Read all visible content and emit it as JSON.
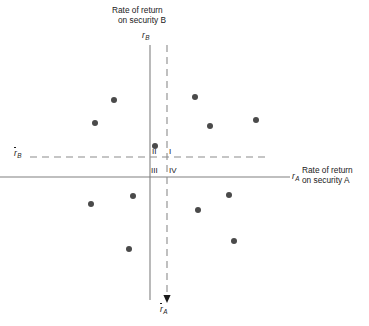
{
  "figure": {
    "background_color": "#ffffff",
    "axis_color": "#808080",
    "dash_color": "#8c8c8c",
    "point_color": "#4a4a4a",
    "text_color": "#1a1a1a"
  },
  "axes": {
    "vertical": {
      "symbol_letter": "r",
      "symbol_subscript": "B",
      "caption_line1": "Rate of return",
      "caption_line2": "on security B",
      "x_px": 150,
      "y_top_px": 45,
      "y_bottom_px": 300
    },
    "horizontal": {
      "symbol_letter": "r",
      "symbol_subscript": "A",
      "caption_line1": "Rate of return",
      "caption_line2": "on security A",
      "y_px": 177,
      "x_left_px": 0,
      "x_right_px": 290
    }
  },
  "reference_lines": {
    "mean_b": {
      "symbol_letter": "r",
      "symbol_subscript": "B",
      "overbar": true,
      "orientation": "horizontal",
      "y_px": 157,
      "x_start_px": 30,
      "x_end_px": 266
    },
    "mean_a": {
      "symbol_letter": "r",
      "symbol_subscript": "A",
      "overbar": true,
      "orientation": "vertical",
      "x_px": 167,
      "y_start_px": 45,
      "y_end_px": 300,
      "has_arrowhead": true
    }
  },
  "quadrants": [
    {
      "name": "quadrant-two",
      "label": "II",
      "x_px": 152,
      "y_px": 147
    },
    {
      "name": "quadrant-one",
      "label": "I",
      "x_px": 169,
      "y_px": 147
    },
    {
      "name": "quadrant-three",
      "label": "III",
      "x_px": 151,
      "y_px": 166
    },
    {
      "name": "quadrant-four",
      "label": "IV",
      "x_px": 169,
      "y_px": 166
    }
  ],
  "chart_data": {
    "type": "scatter",
    "title": "",
    "xlabel": "Rate of return on security A",
    "ylabel": "Rate of return on security B",
    "xlim": [
      0,
      369
    ],
    "ylim": [
      326,
      0
    ],
    "grid": false,
    "legend": false,
    "annotations": [
      "I",
      "II",
      "III",
      "IV"
    ],
    "reference_line_x": 167,
    "reference_line_y": 157,
    "point_count": 12,
    "points_px": [
      {
        "x": 114,
        "y": 100,
        "quadrant": "II"
      },
      {
        "x": 95,
        "y": 123,
        "quadrant": "II"
      },
      {
        "x": 195,
        "y": 97,
        "quadrant": "I"
      },
      {
        "x": 210,
        "y": 126,
        "quadrant": "I"
      },
      {
        "x": 256,
        "y": 120,
        "quadrant": "I"
      },
      {
        "x": 155,
        "y": 146,
        "quadrant": "II"
      },
      {
        "x": 133,
        "y": 196,
        "quadrant": "III"
      },
      {
        "x": 91,
        "y": 204,
        "quadrant": "III"
      },
      {
        "x": 129,
        "y": 249,
        "quadrant": "III"
      },
      {
        "x": 198,
        "y": 210,
        "quadrant": "IV"
      },
      {
        "x": 229,
        "y": 195,
        "quadrant": "IV"
      },
      {
        "x": 234,
        "y": 241,
        "quadrant": "IV"
      }
    ],
    "point_radius_px": 3
  }
}
